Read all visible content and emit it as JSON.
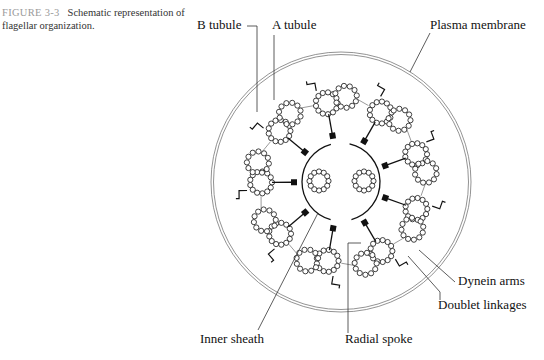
{
  "caption": {
    "figure_number": "FIGURE 3-3",
    "text": "Schematic representation of flagellar organization."
  },
  "labels": {
    "b_tubule": "B tubule",
    "a_tubule": "A tubule",
    "plasma_membrane": "Plasma membrane",
    "dynein_arms": "Dynein arms",
    "doublet_linkages": "Doublet linkages",
    "radial_spoke": "Radial spoke",
    "inner_sheath": "Inner sheath"
  },
  "diagram": {
    "center": [
      341,
      182
    ],
    "membrane_radius": 130,
    "inner_sheath_radius": 39,
    "central_tubules": [
      [
        319,
        181
      ],
      [
        364,
        181
      ]
    ],
    "doublet_count": 9,
    "doublet_ring_radius": 80,
    "spoke_head_radius": 47,
    "stroke_color": "#111111",
    "membrane_color": "#777777"
  }
}
